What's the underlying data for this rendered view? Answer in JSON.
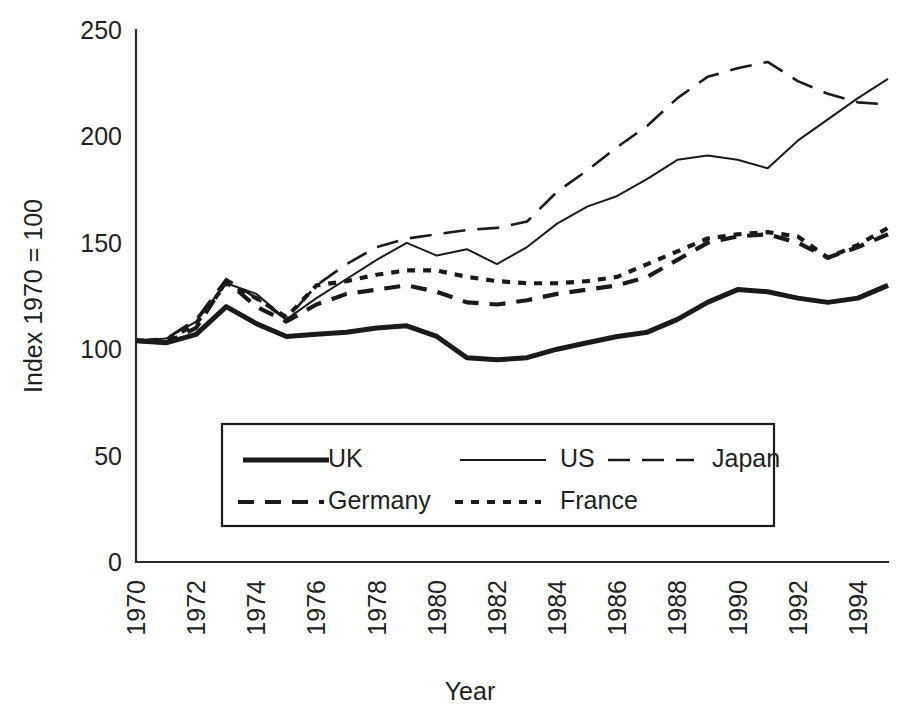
{
  "chart_data": {
    "type": "line",
    "title": "",
    "xlabel": "Year",
    "ylabel": "Index 1970 = 100",
    "xlim": [
      1970,
      1995
    ],
    "ylim": [
      0,
      250
    ],
    "yticks": [
      0,
      50,
      100,
      150,
      200,
      250
    ],
    "xticks": [
      1970,
      1972,
      1974,
      1976,
      1978,
      1980,
      1982,
      1984,
      1986,
      1988,
      1990,
      1992,
      1994
    ],
    "xtick_rotation": 90,
    "grid": false,
    "legend_position": "inside-bottom-center",
    "x": [
      1970,
      1971,
      1972,
      1973,
      1974,
      1975,
      1976,
      1977,
      1978,
      1979,
      1980,
      1981,
      1982,
      1983,
      1984,
      1985,
      1986,
      1987,
      1988,
      1989,
      1990,
      1991,
      1992,
      1993,
      1994,
      1995
    ],
    "series": [
      {
        "name": "UK",
        "style": "solid-thick",
        "stroke_width": 5.0,
        "dash": "none",
        "values": [
          104,
          103,
          107,
          120,
          112,
          106,
          107,
          108,
          110,
          111,
          106,
          96,
          95,
          96,
          100,
          103,
          106,
          108,
          114,
          122,
          128,
          127,
          124,
          122,
          124,
          130
        ]
      },
      {
        "name": "US",
        "style": "solid-thin",
        "stroke_width": 2.0,
        "dash": "none",
        "values": [
          104,
          105,
          113,
          131,
          126,
          114,
          124,
          133,
          142,
          150,
          144,
          147,
          140,
          148,
          159,
          167,
          172,
          180,
          189,
          191,
          189,
          185,
          198,
          208,
          218,
          227
        ]
      },
      {
        "name": "Japan",
        "style": "long-dash",
        "stroke_width": 2.6,
        "dash": "22 12",
        "values": [
          104,
          105,
          114,
          133,
          124,
          114,
          130,
          140,
          148,
          152,
          154,
          156,
          157,
          160,
          174,
          184,
          195,
          205,
          218,
          228,
          232,
          235,
          226,
          220,
          216,
          215
        ]
      },
      {
        "name": "Germany",
        "style": "medium-dash",
        "stroke_width": 4.2,
        "dash": "16 11",
        "values": [
          104,
          103,
          110,
          132,
          120,
          113,
          121,
          126,
          128,
          130,
          127,
          122,
          121,
          123,
          126,
          128,
          130,
          134,
          142,
          150,
          153,
          154,
          150,
          143,
          148,
          154
        ]
      },
      {
        "name": "France",
        "style": "short-dash",
        "stroke_width": 4.2,
        "dash": "8 8",
        "values": [
          104,
          104,
          112,
          131,
          124,
          115,
          130,
          132,
          135,
          137,
          137,
          134,
          132,
          131,
          131,
          132,
          134,
          140,
          146,
          152,
          154,
          155,
          153,
          143,
          149,
          157
        ]
      }
    ]
  },
  "legend": {
    "entries": [
      {
        "label": "UK"
      },
      {
        "label": "US"
      },
      {
        "label": "Japan"
      },
      {
        "label": "Germany"
      },
      {
        "label": "France"
      }
    ]
  },
  "colors": {
    "line": "#1a1a1a",
    "axis": "#2b2b2b",
    "text": "#1f1f1f",
    "background": "#ffffff"
  }
}
